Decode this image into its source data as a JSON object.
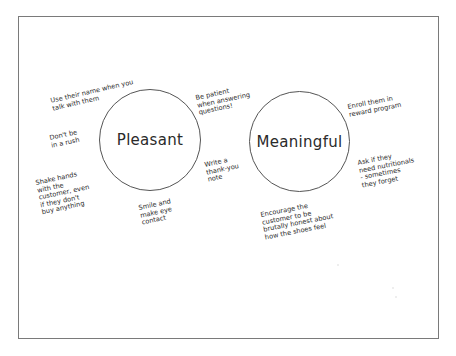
{
  "diagram": {
    "circles": [
      {
        "id": "pleasant",
        "label": "Pleasant"
      },
      {
        "id": "meaningful",
        "label": "Meaningful"
      }
    ],
    "pleasant_notes": [
      {
        "id": "use-name",
        "text": "Use their name when you\ntalk with them"
      },
      {
        "id": "dont-rush",
        "text": "Don't be\nin a rush"
      },
      {
        "id": "shake-hands",
        "text": "Shake hands\nwith the\ncustomer, even\nif they don't\nbuy anything"
      },
      {
        "id": "smile",
        "text": "Smile and\nmake eye\ncontact"
      },
      {
        "id": "be-patient",
        "text": "Be patient\nwhen answering\nquestions!"
      },
      {
        "id": "thank-you",
        "text": "Write a\nthank-you\nnote"
      }
    ],
    "meaningful_notes": [
      {
        "id": "enroll",
        "text": "Enroll them in\nreward program"
      },
      {
        "id": "nutritionals",
        "text": "Ask if they\nneed nutritionals\n- sometimes\nthey forget"
      },
      {
        "id": "encourage",
        "text": "Encourage the\ncustomer to be\nbrutally honest about\nhow the shoes feel"
      }
    ]
  },
  "colors": {
    "background": "#ffffff",
    "frame_border": "#7a7a7a",
    "circle_stroke": "#555555",
    "text": "#2e2e2e"
  }
}
